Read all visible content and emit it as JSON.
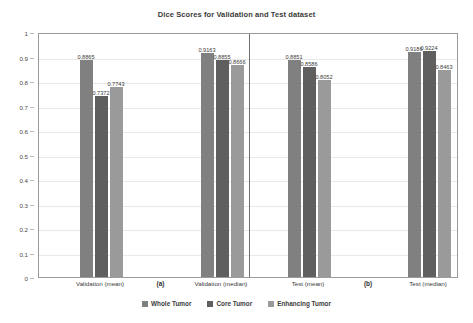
{
  "chart_data": {
    "type": "bar",
    "title": "Dice Scores for Validation and Test dataset",
    "xlabel": "",
    "ylabel": "",
    "ylim": [
      0,
      1
    ],
    "ytick_labels": [
      "1",
      "0.9",
      "0.8",
      "0.7",
      "0.6",
      "0.5",
      "0.4",
      "0.3",
      "0.2",
      "0.1",
      "0"
    ],
    "ytick_values": [
      1,
      0.9,
      0.8,
      0.7,
      0.6,
      0.5,
      0.4,
      0.3,
      0.2,
      0.1,
      0
    ],
    "grid": true,
    "legend_position": "bottom",
    "categories": [
      "Validation (mean)",
      "Validation (median)",
      "Test (mean)",
      "Test (median)"
    ],
    "series": [
      {
        "name": "Whole Tumor",
        "color": "#808080",
        "values": [
          0.8865,
          0.9163,
          0.8851,
          0.9186
        ],
        "labels": [
          "0.8865",
          "0.9163",
          "0.8851",
          "0.9186"
        ]
      },
      {
        "name": "Core Tumor",
        "color": "#5f5f5f",
        "values": [
          0.7372,
          0.8855,
          0.8586,
          0.9224
        ],
        "labels": [
          "0.7372",
          "0.8855",
          "0.8586",
          "0.9224"
        ]
      },
      {
        "name": "Enhancing Tumor",
        "color": "#9a9a9a",
        "values": [
          0.7743,
          0.8666,
          0.8052,
          0.8463
        ],
        "labels": [
          "0.7743",
          "0.8666",
          "0.8052",
          "0.8463"
        ]
      }
    ],
    "panels": [
      {
        "tag": "(a)",
        "categories": [
          "Validation (mean)",
          "Validation (median)"
        ]
      },
      {
        "tag": "(b)",
        "categories": [
          "Test (mean)",
          "Test (median)"
        ]
      }
    ],
    "annotations": [
      "(a)",
      "(b)"
    ]
  },
  "legend": {
    "items": [
      {
        "label": "Whole Tumor",
        "color": "#808080"
      },
      {
        "label": "Core Tumor",
        "color": "#5f5f5f"
      },
      {
        "label": "Enhancing Tumor",
        "color": "#9a9a9a"
      }
    ]
  }
}
